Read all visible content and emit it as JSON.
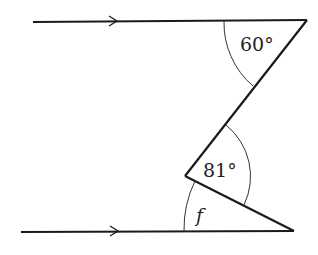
{
  "diagram": {
    "type": "parallel-lines-angles",
    "colors": {
      "stroke": "#1a1a1a",
      "background": "#ffffff"
    },
    "parallel_lines": [
      {
        "name": "top-line",
        "has_arrow": true
      },
      {
        "name": "bottom-line",
        "has_arrow": true
      }
    ],
    "angles": {
      "top": "60°",
      "middle": "81°",
      "unknown": "f"
    }
  }
}
